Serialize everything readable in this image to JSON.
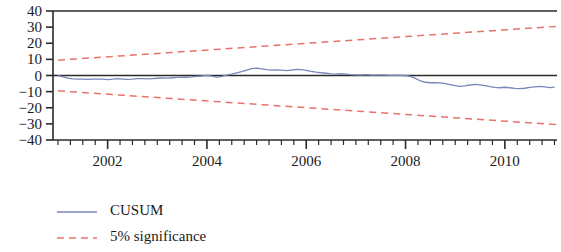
{
  "chart_data": {
    "type": "line",
    "title": "",
    "xlabel": "",
    "ylabel": "",
    "xlim": [
      2000.9,
      2011.05
    ],
    "ylim": [
      -40,
      40
    ],
    "grid": false,
    "legend_position": "below-left",
    "y_ticks": [
      "40",
      "30",
      "20",
      "10",
      "0",
      "-10",
      "-20",
      "-30",
      "-40"
    ],
    "y_tick_values": [
      40,
      30,
      20,
      10,
      0,
      -10,
      -20,
      -30,
      -40
    ],
    "x_ticks": [
      "2002",
      "2004",
      "2006",
      "2008",
      "2010"
    ],
    "x_tick_values": [
      2002,
      2004,
      2006,
      2008,
      2010
    ],
    "x_minor_tick_values": [
      2001.0,
      2001.25,
      2001.5,
      2001.75,
      2002.25,
      2002.5,
      2002.75,
      2003.0,
      2003.25,
      2003.5,
      2003.75,
      2004.25,
      2004.5,
      2004.75,
      2005.0,
      2005.25,
      2005.5,
      2005.75,
      2006.25,
      2006.5,
      2006.75,
      2007.0,
      2007.25,
      2007.5,
      2007.75,
      2008.25,
      2008.5,
      2008.75,
      2009.0,
      2009.25,
      2009.5,
      2009.75,
      2010.25,
      2010.5,
      2010.75,
      2011.0
    ],
    "zero_line": 0,
    "colors": {
      "cusum": "#7a86b8",
      "significance": "#e8736a",
      "axis": "#2b2b2b",
      "zero_line": "#2b2b2b",
      "text": "#1a1a1a"
    },
    "series": [
      {
        "name": "CUSUM",
        "style": "solid",
        "color": "#7a86b8",
        "x": [
          2001.0,
          2001.1,
          2001.2,
          2001.3,
          2001.4,
          2001.5,
          2001.6,
          2001.7,
          2001.8,
          2001.9,
          2002.0,
          2002.1,
          2002.2,
          2002.3,
          2002.4,
          2002.5,
          2002.6,
          2002.7,
          2002.8,
          2002.9,
          2003.0,
          2003.1,
          2003.2,
          2003.3,
          2003.4,
          2003.5,
          2003.6,
          2003.7,
          2003.8,
          2003.9,
          2004.0,
          2004.1,
          2004.2,
          2004.3,
          2004.4,
          2004.5,
          2004.6,
          2004.7,
          2004.8,
          2004.9,
          2005.0,
          2005.1,
          2005.2,
          2005.3,
          2005.4,
          2005.5,
          2005.6,
          2005.7,
          2005.8,
          2005.9,
          2006.0,
          2006.1,
          2006.2,
          2006.3,
          2006.4,
          2006.5,
          2006.6,
          2006.7,
          2006.8,
          2006.9,
          2007.0,
          2007.1,
          2007.2,
          2007.3,
          2007.4,
          2007.5,
          2007.6,
          2007.7,
          2007.8,
          2007.9,
          2008.0,
          2008.1,
          2008.2,
          2008.3,
          2008.4,
          2008.5,
          2008.6,
          2008.7,
          2008.8,
          2008.9,
          2009.0,
          2009.1,
          2009.2,
          2009.3,
          2009.4,
          2009.5,
          2009.6,
          2009.7,
          2009.8,
          2009.9,
          2010.0,
          2010.1,
          2010.2,
          2010.3,
          2010.4,
          2010.5,
          2010.6,
          2010.7,
          2010.8,
          2010.9,
          2011.0
        ],
        "y": [
          0.0,
          -0.8,
          -1.6,
          -2.1,
          -2.3,
          -2.2,
          -2.4,
          -2.3,
          -2.2,
          -2.3,
          -2.5,
          -2.3,
          -2.0,
          -2.2,
          -2.4,
          -2.2,
          -1.9,
          -2.0,
          -2.1,
          -1.9,
          -1.7,
          -1.5,
          -1.6,
          -1.4,
          -1.2,
          -1.0,
          -1.1,
          -0.9,
          -0.6,
          -0.3,
          0.1,
          -0.4,
          -1.0,
          -0.6,
          0.2,
          0.9,
          1.6,
          2.4,
          3.4,
          4.2,
          4.6,
          4.1,
          3.6,
          3.3,
          3.5,
          3.3,
          3.0,
          3.4,
          3.8,
          3.6,
          3.2,
          2.6,
          2.1,
          1.7,
          1.4,
          1.0,
          0.9,
          1.1,
          0.9,
          0.6,
          0.4,
          0.3,
          0.5,
          0.3,
          0.2,
          0.3,
          0.2,
          0.1,
          0.2,
          0.1,
          0.0,
          -0.5,
          -1.8,
          -3.4,
          -4.2,
          -4.5,
          -4.4,
          -4.6,
          -5.0,
          -5.6,
          -6.3,
          -6.8,
          -6.4,
          -5.9,
          -5.5,
          -5.8,
          -6.3,
          -6.9,
          -7.4,
          -7.6,
          -7.3,
          -7.6,
          -8.0,
          -8.2,
          -7.9,
          -7.4,
          -7.0,
          -6.8,
          -7.1,
          -7.5,
          -7.2
        ]
      },
      {
        "name": "5% significance upper",
        "style": "dashed",
        "color": "#e8736a",
        "x": [
          2001.0,
          2011.05
        ],
        "y": [
          9.5,
          30.5
        ]
      },
      {
        "name": "5% significance lower",
        "style": "dashed",
        "color": "#e8736a",
        "x": [
          2001.0,
          2011.05
        ],
        "y": [
          -9.5,
          -30.5
        ]
      }
    ],
    "legend": [
      {
        "label": "CUSUM",
        "style": "solid",
        "color": "#7a86b8"
      },
      {
        "label": "5% significance",
        "style": "dashed",
        "color": "#e8736a"
      }
    ]
  }
}
